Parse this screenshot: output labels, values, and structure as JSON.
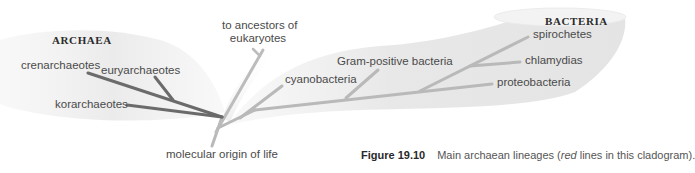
{
  "diagram": {
    "type": "cladogram",
    "groups": {
      "archaea": {
        "label": "ARCHAEA"
      },
      "bacteria": {
        "label": "BACTERIA"
      }
    },
    "archaea_lineages": [
      {
        "label": "crenarchaeotes"
      },
      {
        "label": "euryarchaeotes"
      },
      {
        "label": "korarchaeotes"
      }
    ],
    "eukaryote_branch": {
      "line1": "to ancestors of",
      "line2": "eukaryotes"
    },
    "bacteria_lineages": [
      {
        "label": "cyanobacteria"
      },
      {
        "label": "Gram-positive bacteria"
      },
      {
        "label": "spirochetes"
      },
      {
        "label": "chlamydias"
      },
      {
        "label": "proteobacteria"
      }
    ],
    "root_label": "molecular origin of life",
    "colors": {
      "archaea_lines": "#6b6b6b",
      "other_lines": "#b9b9b9",
      "band_fill": "#ececec",
      "text": "#4a4a4a"
    }
  },
  "caption": {
    "figure_number": "Figure 19.10",
    "text_before": "Main archaean lineages (",
    "emphasis": "red",
    "text_after": " lines in this cladogram)."
  }
}
